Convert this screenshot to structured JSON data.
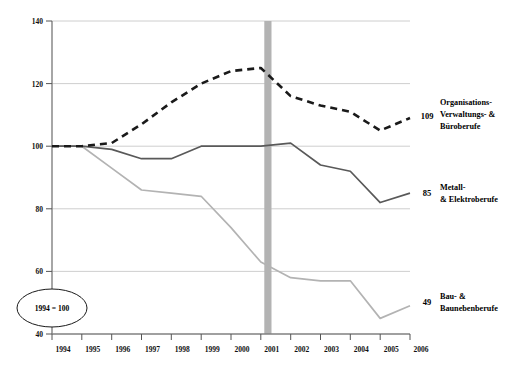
{
  "chart_data": {
    "type": "line",
    "title": "",
    "subtitle": "",
    "xlabel": "",
    "ylabel": "",
    "x": [
      1994,
      1995,
      1996,
      1997,
      1998,
      1999,
      2000,
      2001,
      2002,
      2003,
      2004,
      2005,
      2006
    ],
    "xticklabels": [
      "1994",
      "1995",
      "1996",
      "1997",
      "1998",
      "1999",
      "2000",
      "2001",
      "2002",
      "2003",
      "2004",
      "2005",
      "2006"
    ],
    "yticks": [
      40,
      60,
      80,
      100,
      120,
      140
    ],
    "yticklabels": [
      "40",
      "60",
      "80",
      "100",
      "120",
      "140"
    ],
    "ylim": [
      40,
      140
    ],
    "xlim": [
      1994,
      2006
    ],
    "grid": "horizontal",
    "legend_position": "right-inline",
    "series": [
      {
        "name": "Organisations-­Verwaltungs- & Büroberufe",
        "label_line1": "Organisations-",
        "label_line2": "Verwaltungs- &",
        "label_line3": "Büroberufe",
        "end_value": "109",
        "style": "dashed",
        "color": "#1a1a1a",
        "values": [
          100,
          100,
          101,
          107,
          114,
          120,
          124,
          125,
          116,
          113,
          111,
          105,
          109
        ]
      },
      {
        "name": "Metall- & Elektroberufe",
        "label_line1": "Metall-",
        "label_line2": "& Elektroberufe",
        "label_line3": "",
        "end_value": "85",
        "style": "solid",
        "color": "#595959",
        "values": [
          100,
          100,
          99,
          96,
          96,
          100,
          100,
          100,
          101,
          94,
          92,
          82,
          85
        ]
      },
      {
        "name": "Bau- & Baunebenberufe",
        "label_line1": "Bau- &",
        "label_line2": "Baunebenberufe",
        "label_line3": "",
        "end_value": "49",
        "style": "solid",
        "color": "#b3b3b3",
        "values": [
          100,
          100,
          93,
          86,
          85,
          84,
          74,
          63,
          58,
          57,
          57,
          45,
          49
        ]
      }
    ],
    "annotations": [
      {
        "name": "base-year-note",
        "text": "1994 = 100",
        "shape": "ellipse",
        "x": 1994,
        "y": 48
      },
      {
        "name": "highlight-band",
        "text": "",
        "shape": "vertical-band",
        "x_start": 2001.4,
        "x_end": 2001.65,
        "color": "#b3b3b3"
      }
    ]
  },
  "axes": {
    "y_axis_name": "index-axis",
    "x_axis_name": "year-axis"
  }
}
